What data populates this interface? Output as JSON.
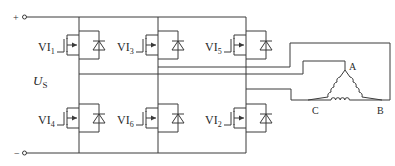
{
  "diagram": {
    "type": "three-phase bridge inverter driving delta-connected motor",
    "supply": {
      "plus_label": "+",
      "minus_label": "−",
      "voltage_label_main": "U",
      "voltage_label_sub": "S"
    },
    "switches": [
      {
        "id": "VI1",
        "main": "VI",
        "sub": "1",
        "position": "upper",
        "leg": 1
      },
      {
        "id": "VI3",
        "main": "VI",
        "sub": "3",
        "position": "upper",
        "leg": 2
      },
      {
        "id": "VI5",
        "main": "VI",
        "sub": "5",
        "position": "upper",
        "leg": 3
      },
      {
        "id": "VI4",
        "main": "VI",
        "sub": "4",
        "position": "lower",
        "leg": 1
      },
      {
        "id": "VI6",
        "main": "VI",
        "sub": "6",
        "position": "lower",
        "leg": 2
      },
      {
        "id": "VI2",
        "main": "VI",
        "sub": "2",
        "position": "lower",
        "leg": 3
      }
    ],
    "motor_nodes": {
      "a": "A",
      "b": "B",
      "c": "C"
    },
    "colors": {
      "line": "#3a3a3a",
      "text": "#2a2a2a",
      "background": "#ffffff"
    }
  }
}
